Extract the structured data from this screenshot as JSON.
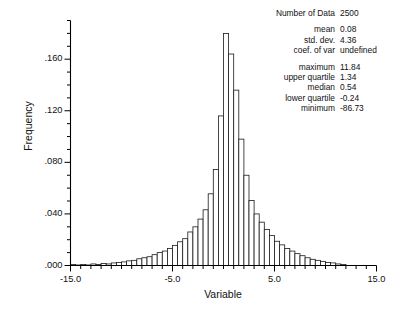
{
  "chart_data": {
    "type": "bar",
    "title": "",
    "xlabel": "Variable",
    "ylabel": "Frequency",
    "xlim": [
      -15.0,
      15.0
    ],
    "ylim": [
      0.0,
      0.19
    ],
    "grid": false,
    "legend": null,
    "bin_width": 0.5,
    "x_ticks_major": [
      -15.0,
      -5.0,
      5.0,
      15.0
    ],
    "x_tick_labels": [
      "-15.0",
      "-5.0",
      "5.0",
      "15.0"
    ],
    "x_tick_minor_step": 1.0,
    "y_ticks_major": [
      0.0,
      0.04,
      0.08,
      0.12,
      0.16
    ],
    "y_tick_labels": [
      ".000",
      ".040",
      ".080",
      ".120",
      ".160"
    ],
    "y_tick_minor_step": 0.01,
    "bin_centers": [
      -14.75,
      -14.25,
      -13.75,
      -13.25,
      -12.75,
      -12.25,
      -11.75,
      -11.25,
      -10.75,
      -10.25,
      -9.75,
      -9.25,
      -8.75,
      -8.25,
      -7.75,
      -7.25,
      -6.75,
      -6.25,
      -5.75,
      -5.25,
      -4.75,
      -4.25,
      -3.75,
      -3.25,
      -2.75,
      -2.25,
      -1.75,
      -1.25,
      -0.75,
      -0.25,
      0.25,
      0.75,
      1.25,
      1.75,
      2.25,
      2.75,
      3.25,
      3.75,
      4.25,
      4.75,
      5.25,
      5.75,
      6.25,
      6.75,
      7.25,
      7.75,
      8.25,
      8.75,
      9.25,
      9.75,
      10.25,
      10.75,
      11.25,
      11.75
    ],
    "values": [
      0.0008,
      0.0004,
      0.0008,
      0.0004,
      0.0012,
      0.0008,
      0.0016,
      0.0012,
      0.002,
      0.0024,
      0.0028,
      0.0036,
      0.004,
      0.0052,
      0.006,
      0.0068,
      0.0084,
      0.01,
      0.0112,
      0.0132,
      0.0156,
      0.0184,
      0.0208,
      0.026,
      0.03,
      0.036,
      0.0432,
      0.0556,
      0.0744,
      0.116,
      0.18,
      0.164,
      0.136,
      0.098,
      0.07,
      0.0504,
      0.04,
      0.0336,
      0.028,
      0.0232,
      0.0188,
      0.016,
      0.0132,
      0.0112,
      0.0092,
      0.0076,
      0.006,
      0.0048,
      0.004,
      0.0032,
      0.0024,
      0.002,
      0.0012,
      0.0008
    ]
  },
  "stats": {
    "groups": [
      [
        {
          "label": "Number of Data",
          "value": "2500"
        }
      ],
      [
        {
          "label": "mean",
          "value": "0.08"
        },
        {
          "label": "std. dev.",
          "value": "4.36"
        },
        {
          "label": "coef. of var",
          "value": "undefined"
        }
      ],
      [
        {
          "label": "maximum",
          "value": "11.84"
        },
        {
          "label": "upper quartile",
          "value": "1.34"
        },
        {
          "label": "median",
          "value": "0.54"
        },
        {
          "label": "lower quartile",
          "value": "-0.24"
        },
        {
          "label": "minimum",
          "value": "-86.73"
        }
      ]
    ]
  },
  "colors": {
    "axis": "#000000",
    "bar_stroke": "#1a1a1a",
    "bar_fill": "#ffffff",
    "text": "#111111",
    "background": "#ffffff"
  }
}
